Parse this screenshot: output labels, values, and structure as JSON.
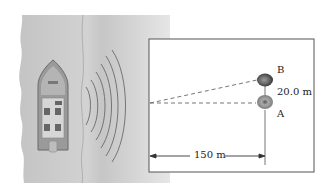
{
  "diagram": {
    "labels": {
      "rock_b": "B",
      "rock_a": "A",
      "separation": "20.0 m",
      "distance": "150 m"
    },
    "colors": {
      "water": "#c9c9c9",
      "water_light": "#dcdcdc",
      "box_border": "#555555",
      "dashed_line": "#666666",
      "rock_dark": "#3a3a3a",
      "rock_light": "#8a8a8a"
    }
  }
}
